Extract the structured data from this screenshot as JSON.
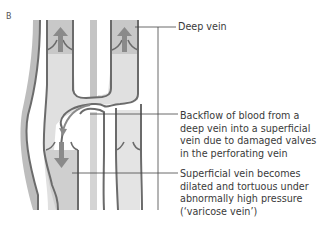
{
  "panel": {
    "letter": "B"
  },
  "labels": {
    "deep_vein": "Deep vein",
    "backflow": "Backflow of blood from a deep vein into a superficial vein due to damaged valves in the perforating vein",
    "superficial": "Superficial vein becomes dilated and tortuous under abnormally high pressure (‘varicose vein’)"
  },
  "colors": {
    "vein_wall": "#6b6b6b",
    "vein_fill": "#d9d9d9",
    "deep_fill": "#c8c8c8",
    "center_bar": "#c4c4c4",
    "arrow": "#8a8a8a",
    "leader_line": "#444444"
  }
}
